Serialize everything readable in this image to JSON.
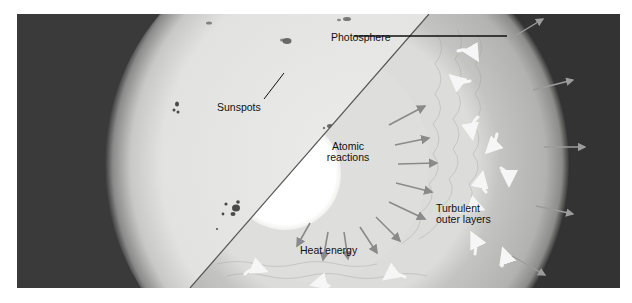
{
  "diagram": {
    "labels": {
      "photosphere": "Photosphere",
      "sunspots": "Sunspots",
      "atomic_reactions_line1": "Atomic",
      "atomic_reactions_line2": "reactions",
      "turbulent_line1": "Turbulent",
      "turbulent_line2": "outer layers",
      "heat_energy": "Heat energy"
    },
    "colors": {
      "background_frame": "#3a3a3a",
      "sun_surface": "#e6e6e4",
      "sun_limb": "#7a7a7a",
      "core": "#ffffff",
      "radiative_zone": "#dcdcda",
      "convective_zone": "#b8b8b6",
      "arrow": "#8a8a8a",
      "curved_arrow": "#f4f4f4",
      "leader_line": "#111111",
      "sunspot": "#4a4a4a"
    }
  }
}
